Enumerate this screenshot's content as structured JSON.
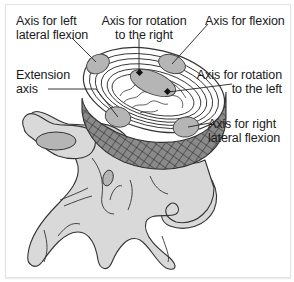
{
  "figure": {
    "colors": {
      "bone_fill": "#d9d9d9",
      "axis_ellipse_fill": "#b5b5b5",
      "outline": "#333333",
      "frame_border": "#e4e4e4",
      "text": "#1a1a1a"
    }
  },
  "labels": {
    "left_lateral_flexion": {
      "line1": "Axis for left",
      "line2": "lateral flexion"
    },
    "rotation_right": {
      "line1": "Axis for rotation",
      "line2": "to the right"
    },
    "flexion": {
      "line1": "Axis for flexion"
    },
    "extension": {
      "line1": "Extension",
      "line2": "axis"
    },
    "rotation_left": {
      "line1": "Axis for rotation",
      "line2": "to the left"
    },
    "right_lateral_flexion": {
      "line1": "Axis for right",
      "line2": "lateral flexion"
    }
  }
}
